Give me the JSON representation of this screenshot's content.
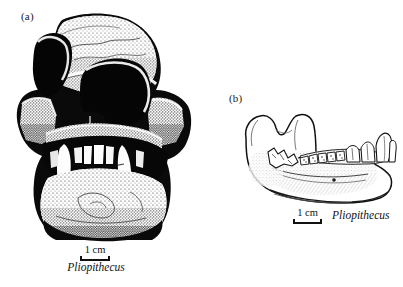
{
  "figure": {
    "kind": "scientific-illustration",
    "background_color": "#ffffff",
    "ink_color": "#111111",
    "panels": [
      {
        "id": "a",
        "label": "(a)",
        "specimen": "cranium-anterior-view",
        "technique": "stipple-and-ink",
        "scale": {
          "value": "1 cm",
          "bar_length_px": 30
        },
        "caption": "Pliopithecus"
      },
      {
        "id": "b",
        "label": "(b)",
        "specimen": "mandible-lateral-view",
        "technique": "line-drawing",
        "scale": {
          "value": "1 cm",
          "bar_length_px": 29
        },
        "caption": "Pliopithecus"
      }
    ]
  },
  "panel_a": {
    "label": "(a)",
    "scale_label": "1 cm",
    "taxon": "Pliopithecus"
  },
  "panel_b": {
    "label": "(b)",
    "scale_label": "1 cm",
    "taxon": "Pliopithecus"
  }
}
